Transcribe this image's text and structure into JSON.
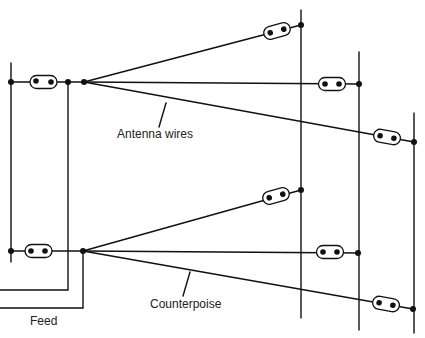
{
  "diagram": {
    "type": "antenna-with-counterpoise",
    "labels": {
      "antenna_wires": "Antenna wires",
      "counterpoise": "Counterpoise",
      "feed": "Feed"
    },
    "colors": {
      "line": "#111111",
      "label": "#222222",
      "background": "#ffffff"
    },
    "upper_array": {
      "name": "Antenna wires",
      "wire_count": 3,
      "insulators": 4
    },
    "lower_array": {
      "name": "Counterpoise",
      "wire_count": 3,
      "insulators": 4
    },
    "supports": {
      "left_pole": 1,
      "right_poles": 3
    }
  }
}
